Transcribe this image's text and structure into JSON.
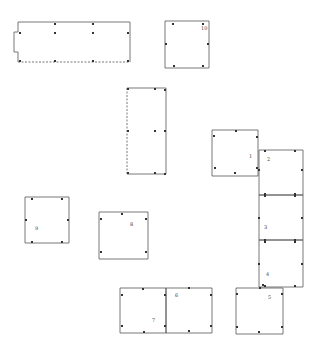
{
  "diagram": {
    "type": "hand-drawn layout plan",
    "stroke_color": "#555555",
    "dot_color": "#333333",
    "boxes": [
      {
        "id": "A",
        "label": "",
        "x": 18,
        "y": 22,
        "w": 112,
        "h": 40,
        "dashed_side": "bottom",
        "notch": true,
        "dots": [
          [
            55,
            24
          ],
          [
            93,
            24
          ],
          [
            20,
            33
          ],
          [
            55,
            33
          ],
          [
            93,
            33
          ],
          [
            128,
            33
          ],
          [
            20,
            61
          ],
          [
            55,
            61
          ],
          [
            93,
            61
          ],
          [
            128,
            61
          ]
        ]
      },
      {
        "id": "10",
        "label": "10",
        "x": 165,
        "y": 21,
        "w": 44,
        "h": 47,
        "dashed_side": "",
        "dots": [
          [
            173,
            24
          ],
          [
            203,
            24
          ],
          [
            166,
            44
          ],
          [
            208,
            44
          ],
          [
            174,
            66
          ],
          [
            203,
            66
          ]
        ]
      },
      {
        "id": "B",
        "label": "",
        "x": 127,
        "y": 88,
        "w": 39,
        "h": 86,
        "dashed_side": "left",
        "dots": [
          [
            128,
            89
          ],
          [
            155,
            89
          ],
          [
            165,
            90
          ],
          [
            128,
            131
          ],
          [
            155,
            131
          ],
          [
            165,
            131
          ],
          [
            128,
            173
          ],
          [
            155,
            173
          ],
          [
            165,
            174
          ]
        ]
      },
      {
        "id": "1",
        "label": "1",
        "x": 212,
        "y": 130,
        "w": 46,
        "h": 46,
        "dashed_side": "",
        "dots": [
          [
            214,
            136
          ],
          [
            236,
            131
          ],
          [
            257,
            137
          ],
          [
            215,
            168
          ],
          [
            235,
            173
          ],
          [
            257,
            168
          ]
        ]
      },
      {
        "id": "2",
        "label": "2",
        "x": 259,
        "y": 150,
        "w": 44,
        "h": 45,
        "dashed_side": "",
        "dots": [
          [
            265,
            151
          ],
          [
            295,
            151
          ],
          [
            259,
            170
          ],
          [
            302,
            170
          ],
          [
            265,
            194
          ],
          [
            295,
            194
          ]
        ]
      },
      {
        "id": "3",
        "label": "3",
        "x": 259,
        "y": 195,
        "w": 44,
        "h": 45,
        "dashed_side": "",
        "dots": [
          [
            265,
            196
          ],
          [
            295,
            196
          ],
          [
            259,
            218
          ],
          [
            302,
            218
          ],
          [
            265,
            240
          ],
          [
            295,
            240
          ]
        ]
      },
      {
        "id": "4",
        "label": "4",
        "x": 259,
        "y": 240,
        "w": 44,
        "h": 47,
        "dashed_side": "",
        "dots": [
          [
            265,
            242
          ],
          [
            295,
            242
          ],
          [
            259,
            264
          ],
          [
            302,
            264
          ],
          [
            265,
            286
          ],
          [
            295,
            286
          ]
        ]
      },
      {
        "id": "5",
        "label": "5",
        "x": 236,
        "y": 288,
        "w": 47,
        "h": 46,
        "dashed_side": "",
        "dots": [
          [
            237,
            294
          ],
          [
            260,
            288
          ],
          [
            263,
            285
          ],
          [
            282,
            294
          ],
          [
            237,
            327
          ],
          [
            259,
            332
          ],
          [
            282,
            327
          ]
        ]
      },
      {
        "id": "9",
        "label": "9",
        "x": 25,
        "y": 197,
        "w": 44,
        "h": 46,
        "dashed_side": "",
        "dots": [
          [
            32,
            199
          ],
          [
            62,
            199
          ],
          [
            26,
            220
          ],
          [
            68,
            220
          ],
          [
            32,
            242
          ],
          [
            62,
            242
          ]
        ]
      },
      {
        "id": "8",
        "label": "8",
        "x": 99,
        "y": 212,
        "w": 49,
        "h": 47,
        "dashed_side": "",
        "dots": [
          [
            101,
            219
          ],
          [
            122,
            214
          ],
          [
            146,
            219
          ],
          [
            101,
            252
          ],
          [
            146,
            252
          ]
        ]
      },
      {
        "id": "7",
        "label": "7",
        "x": 120,
        "y": 288,
        "w": 46,
        "h": 45,
        "dashed_side": "",
        "dots": [
          [
            122,
            295
          ],
          [
            143,
            289
          ],
          [
            165,
            295
          ],
          [
            122,
            326
          ],
          [
            144,
            332
          ],
          [
            165,
            326
          ]
        ]
      },
      {
        "id": "6",
        "label": "6",
        "x": 166,
        "y": 288,
        "w": 46,
        "h": 45,
        "dashed_side": "",
        "dots": [
          [
            189,
            288
          ],
          [
            211,
            295
          ],
          [
            211,
            326
          ],
          [
            189,
            331
          ]
        ]
      }
    ],
    "labels": [
      {
        "text": "10",
        "x": 201,
        "y": 30
      },
      {
        "text": "1",
        "x": 249,
        "y": 158
      },
      {
        "text": "2",
        "x": 267,
        "y": 161
      },
      {
        "text": "3",
        "x": 264,
        "y": 229
      },
      {
        "text": "4",
        "x": 266,
        "y": 276
      },
      {
        "text": "5",
        "x": 268,
        "y": 299
      },
      {
        "text": "9",
        "x": 35,
        "y": 230
      },
      {
        "text": "8",
        "x": 130,
        "y": 226
      },
      {
        "text": "7",
        "x": 152,
        "y": 322
      },
      {
        "text": "6",
        "x": 175,
        "y": 297
      }
    ]
  }
}
